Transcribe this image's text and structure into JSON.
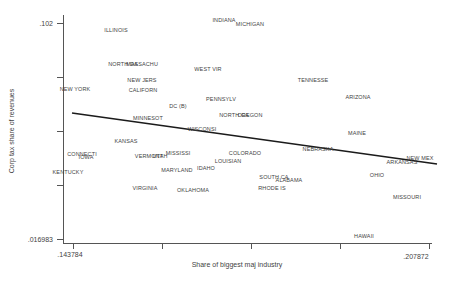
{
  "figure": {
    "background": "#ffffff",
    "axis_color": "#555555",
    "label_color": "#3f3f3f",
    "fit_line_color": "#1b1b1b"
  },
  "axes": {
    "y_title": "Corp tax share of revenues",
    "x_title": "Share of biggest maj industry",
    "y_top_tick_label": ".102",
    "y_bottom_tick_label": ".016983",
    "x_left_tick_label": ".143784",
    "x_right_tick_label": ".207872"
  },
  "layout_px": {
    "plot_left": 63,
    "plot_top": 15,
    "plot_right": 432,
    "plot_bottom": 243,
    "y_ticks": [
      23,
      77,
      131,
      185,
      239
    ],
    "x_ticks": [
      73,
      162,
      251,
      340,
      429
    ]
  },
  "chart_data": {
    "type": "scatter",
    "marker": "state-name-text-labels",
    "title": "",
    "xlabel": "Share of biggest maj industry",
    "ylabel": "Corp tax share of revenues",
    "xlim": [
      0.143784,
      0.207872
    ],
    "ylim": [
      0.016983,
      0.102
    ],
    "grid": false,
    "legend": "none",
    "fit_line": {
      "x1": 0.1436,
      "y1": 0.0666,
      "x2": 0.2093,
      "y2": 0.0465,
      "px1": 72,
      "py1": 113,
      "px2": 437,
      "py2": 164
    },
    "points": [
      {
        "label": "ILLINOIS",
        "x": 0.1515,
        "y": 0.0992,
        "px": 116,
        "py": 30
      },
      {
        "label": "INDIANA",
        "x": 0.171,
        "y": 0.1032,
        "px": 224,
        "py": 20
      },
      {
        "label": "MICHIGAN",
        "x": 0.1758,
        "y": 0.1016,
        "px": 250,
        "py": 24
      },
      {
        "label": "NORTH DA",
        "x": 0.1528,
        "y": 0.0859,
        "px": 123,
        "py": 64
      },
      {
        "label": "MASSACHU",
        "x": 0.1562,
        "y": 0.0859,
        "px": 142,
        "py": 64
      },
      {
        "label": "WEST VIR",
        "x": 0.1683,
        "y": 0.0843,
        "px": 208,
        "py": 69
      },
      {
        "label": "NEW JERS",
        "x": 0.1562,
        "y": 0.0796,
        "px": 142,
        "py": 80
      },
      {
        "label": "CALIFORN",
        "x": 0.1564,
        "y": 0.0756,
        "px": 143,
        "py": 90
      },
      {
        "label": "NEW YORK",
        "x": 0.1443,
        "y": 0.076,
        "px": 75,
        "py": 89
      },
      {
        "label": "TENNESSE",
        "x": 0.187,
        "y": 0.0796,
        "px": 313,
        "py": 80
      },
      {
        "label": "PENNSYLV",
        "x": 0.1704,
        "y": 0.0721,
        "px": 221,
        "py": 99
      },
      {
        "label": "ARIZONA",
        "x": 0.1953,
        "y": 0.0729,
        "px": 358,
        "py": 97
      },
      {
        "label": "DC (B)",
        "x": 0.1627,
        "y": 0.0693,
        "px": 178,
        "py": 106
      },
      {
        "label": "MINNESOT",
        "x": 0.1573,
        "y": 0.0646,
        "px": 148,
        "py": 118
      },
      {
        "label": "NORTH CA",
        "x": 0.1728,
        "y": 0.0658,
        "px": 234,
        "py": 115
      },
      {
        "label": "OREGON",
        "x": 0.1756,
        "y": 0.0658,
        "px": 250,
        "py": 115
      },
      {
        "label": "MAINE",
        "x": 0.1949,
        "y": 0.0587,
        "px": 357,
        "py": 133
      },
      {
        "label": "WISCONSI",
        "x": 0.167,
        "y": 0.0603,
        "px": 202,
        "py": 129
      },
      {
        "label": "KANSAS",
        "x": 0.1533,
        "y": 0.0556,
        "px": 126,
        "py": 141
      },
      {
        "label": "NEBRASKA",
        "x": 0.1879,
        "y": 0.0524,
        "px": 318,
        "py": 149
      },
      {
        "label": "COLORADO",
        "x": 0.1747,
        "y": 0.0508,
        "px": 245,
        "py": 153
      },
      {
        "label": "MISSISSI",
        "x": 0.1627,
        "y": 0.0508,
        "px": 178,
        "py": 153
      },
      {
        "label": "VERMONT",
        "x": 0.1575,
        "y": 0.0497,
        "px": 149,
        "py": 156
      },
      {
        "label": "UTAH",
        "x": 0.1595,
        "y": 0.0497,
        "px": 160,
        "py": 156
      },
      {
        "label": "CONNECTI",
        "x": 0.1454,
        "y": 0.0504,
        "px": 82,
        "py": 154
      },
      {
        "label": "IOWA",
        "x": 0.1461,
        "y": 0.0493,
        "px": 86,
        "py": 157
      },
      {
        "label": "LOUISIAN",
        "x": 0.1717,
        "y": 0.0477,
        "px": 228,
        "py": 161
      },
      {
        "label": "KENTUCKY",
        "x": 0.1429,
        "y": 0.0433,
        "px": 68,
        "py": 172
      },
      {
        "label": "MARYLAND",
        "x": 0.1625,
        "y": 0.0441,
        "px": 177,
        "py": 170
      },
      {
        "label": "IDAHO",
        "x": 0.1677,
        "y": 0.0449,
        "px": 206,
        "py": 168
      },
      {
        "label": "ARKANSAS",
        "x": 0.203,
        "y": 0.0473,
        "px": 402,
        "py": 162
      },
      {
        "label": "NEW MEX",
        "x": 0.2063,
        "y": 0.0489,
        "px": 420,
        "py": 158
      },
      {
        "label": "VIRGINIA",
        "x": 0.1567,
        "y": 0.037,
        "px": 145,
        "py": 188
      },
      {
        "label": "OKLAHOMA",
        "x": 0.1654,
        "y": 0.0363,
        "px": 193,
        "py": 190
      },
      {
        "label": "SOUTH CA",
        "x": 0.18,
        "y": 0.0414,
        "px": 274,
        "py": 177
      },
      {
        "label": "ALABAMA",
        "x": 0.1827,
        "y": 0.0402,
        "px": 289,
        "py": 180
      },
      {
        "label": "RHODE IS",
        "x": 0.1796,
        "y": 0.037,
        "px": 272,
        "py": 188
      },
      {
        "label": "OHIO",
        "x": 0.1985,
        "y": 0.0421,
        "px": 377,
        "py": 175
      },
      {
        "label": "MISSOURI",
        "x": 0.2039,
        "y": 0.0335,
        "px": 407,
        "py": 197
      },
      {
        "label": "HAWAII",
        "x": 0.1962,
        "y": 0.0181,
        "px": 364,
        "py": 236
      }
    ]
  }
}
